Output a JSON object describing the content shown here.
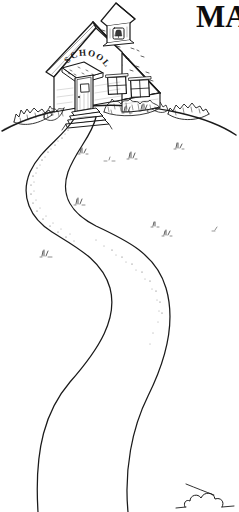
{
  "image": {
    "kind": "line-art-clipart",
    "subject": "one-room schoolhouse on a hill with winding path",
    "width": 239,
    "height": 512,
    "background_color": "#ffffff",
    "ink_color": "#1a1a1a"
  },
  "headline": {
    "text": "MA",
    "note": "bold serif word cropped by right edge of image",
    "color": "#0d0d0d"
  },
  "building": {
    "sign_text": "SCHOOL",
    "sign_style": "hand-lettered arc above porch roof",
    "parts": [
      {
        "name": "cupola",
        "label": "bell tower"
      },
      {
        "name": "bell",
        "label": "bell"
      },
      {
        "name": "main-roof",
        "label": "shingled gable roof"
      },
      {
        "name": "gable-wall",
        "label": "front gable wall"
      },
      {
        "name": "porch-roof",
        "label": "porch roof"
      },
      {
        "name": "door",
        "label": "front door"
      },
      {
        "name": "steps",
        "label": "entry steps"
      },
      {
        "name": "window-left",
        "label": "left window"
      },
      {
        "name": "window-right",
        "label": "right window"
      }
    ]
  },
  "landscape": {
    "hill_label": "grassy hill",
    "path_label": "winding dirt path",
    "shrub_count": 4,
    "grass_tuft_count": 8
  }
}
